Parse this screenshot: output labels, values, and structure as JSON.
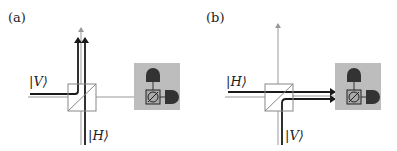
{
  "panels": [
    {
      "label": "(a)",
      "input_top": "|V⟩",
      "input_bottom": "|H⟩"
    },
    {
      "label": "(b)",
      "input_top": "|H⟩",
      "input_bottom": "|V⟩"
    }
  ],
  "colors": {
    "beam_dark": "#1a1a1a",
    "beam_light": "#9a9a9a",
    "detector_box": "#bdbdbd",
    "detector": "#333333"
  }
}
